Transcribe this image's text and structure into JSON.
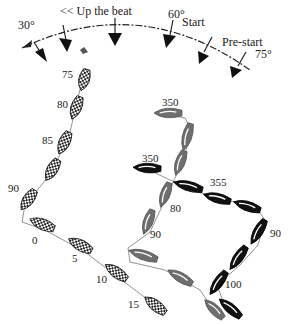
{
  "diagram": {
    "wind_arc": {
      "label_up_the_beat": "<< Up the beat",
      "label_start": "Start",
      "label_prestart": "Pre-start",
      "angle_left": "30°",
      "angle_mid": "60°",
      "angle_right": "75°"
    },
    "boats": {
      "checkered": {
        "style": "checkered",
        "color": "#222222",
        "headings": [
          "75",
          "80",
          "85",
          "90",
          "0",
          "5",
          "10",
          "15"
        ]
      },
      "grey": {
        "style": "solid",
        "color": "#6e6e6e",
        "headings": [
          "350",
          "80",
          "90"
        ]
      },
      "black": {
        "style": "solid",
        "color": "#111111",
        "headings": [
          "350",
          "355",
          "90",
          "100"
        ]
      }
    }
  }
}
